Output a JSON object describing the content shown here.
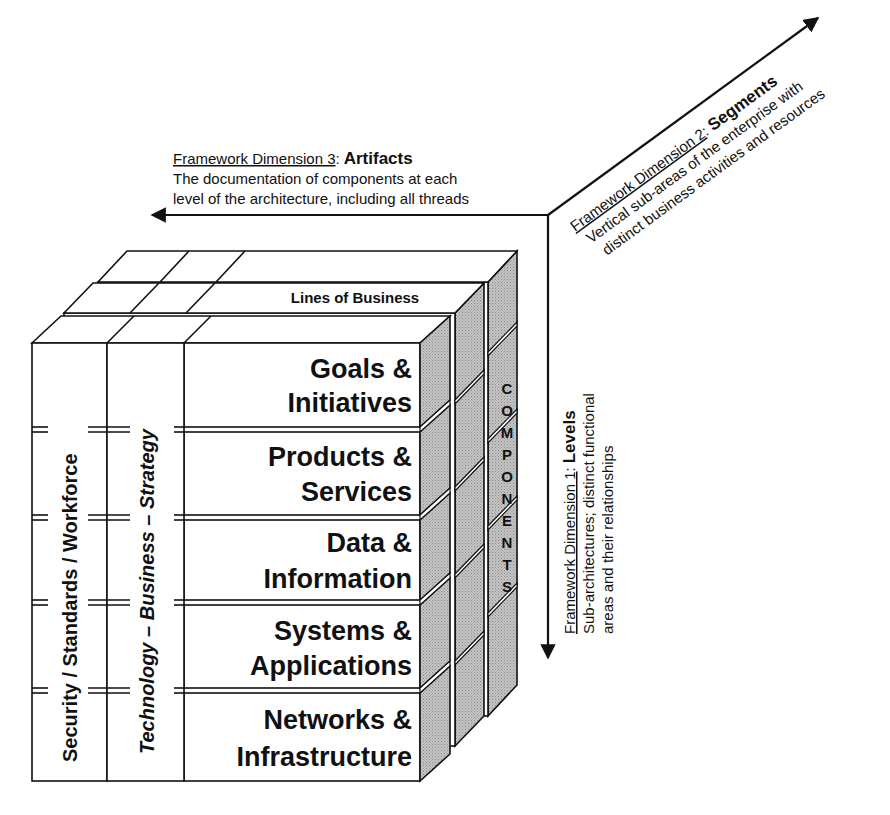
{
  "dimension3": {
    "label": "Framework Dimension 3",
    "colon": ":",
    "name": "Artifacts",
    "line1": "The documentation of components at each",
    "line2": "level of the architecture, including all threads"
  },
  "dimension2": {
    "label": "Framework Dimension 2",
    "colon": ":",
    "name": "Segments",
    "line1": "Vertical sub-areas of the enterprise with",
    "line2": "distinct business activities and resources"
  },
  "dimension1": {
    "label": "Framework Dimension 1",
    "colon": ":",
    "name": "Levels",
    "line1": "Sub-architectures; distinct functional",
    "line2": "areas and their relationships"
  },
  "cube": {
    "lines_of_business": "Lines of Business",
    "components_letters": [
      "C",
      "O",
      "M",
      "P",
      "O",
      "N",
      "E",
      "N",
      "T",
      "S"
    ],
    "thread1": "Security / Standards / Workforce",
    "thread2": {
      "part1": "Technology – ",
      "part2": "Business",
      "part3": " – Strategy"
    },
    "levels": [
      {
        "line1": "Goals &",
        "line2": "Initiatives"
      },
      {
        "line1": "Products &",
        "line2": "Services"
      },
      {
        "line1": "Data &",
        "line2": "Information"
      },
      {
        "line1": "Systems &",
        "line2": "Applications"
      },
      {
        "line1": "Networks &",
        "line2": "Infrastructure"
      }
    ]
  },
  "colors": {
    "line": "#111111",
    "background": "#ffffff",
    "side_face": "#b8b8b8"
  }
}
